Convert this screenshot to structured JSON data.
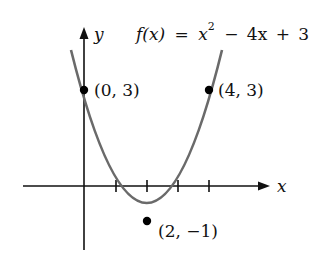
{
  "function": {
    "prefix": "f(x)",
    "equals": "=",
    "x_term": "x",
    "exponent": "2",
    "rest": "− 4x + 3"
  },
  "axes": {
    "x_label": "x",
    "y_label": "y"
  },
  "points": [
    {
      "label": "(0, 3)",
      "x": 0,
      "y": 3
    },
    {
      "label": "(4, 3)",
      "x": 4,
      "y": 3
    },
    {
      "label": "(2, −1)",
      "x": 2,
      "y": -1
    }
  ],
  "x_ticks": [
    1,
    2,
    3,
    4
  ],
  "colors": {
    "curve": "#6a6a6a",
    "axes": "#111111",
    "points": "#000000"
  }
}
